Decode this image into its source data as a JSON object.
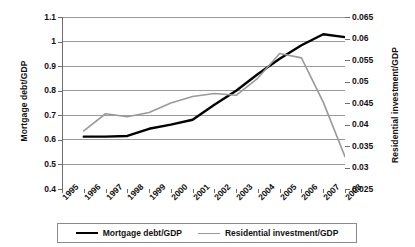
{
  "chart_data": {
    "type": "line",
    "title": "",
    "xlabel": "",
    "ylabel": "Mortgage debt/GDP",
    "y2label": "Residential investment/GDP",
    "grid": true,
    "legend_position": "bottom",
    "categories": [
      "1995",
      "1996",
      "1997",
      "1998",
      "1999",
      "2000",
      "2001",
      "2002",
      "2003",
      "2004",
      "2005",
      "2006",
      "2007",
      "2008"
    ],
    "ylim": [
      0.4,
      1.1
    ],
    "yticks": [
      "0.4",
      "0.5",
      "0.6",
      "0.7",
      "0.8",
      "0.9",
      "1",
      "1.1"
    ],
    "y2lim": [
      0.025,
      0.065
    ],
    "y2ticks": [
      "0.025",
      "0.03",
      "0.035",
      "0.04",
      "0.045",
      "0.05",
      "0.055",
      "0.06",
      "0.065"
    ],
    "series": [
      {
        "name": "Mortgage debt/GDP",
        "axis": "left",
        "color": "#000000",
        "width": 2.4,
        "values": [
          null,
          0.613,
          0.613,
          0.616,
          0.645,
          0.662,
          0.682,
          0.743,
          0.8,
          0.868,
          0.93,
          0.985,
          1.03,
          1.018
        ]
      },
      {
        "name": "Residential investment/GDP",
        "axis": "right",
        "color": "#9a9a9a",
        "width": 1.6,
        "values": [
          null,
          0.0385,
          0.0425,
          0.0418,
          0.0428,
          0.045,
          0.0465,
          0.0472,
          0.0468,
          0.0508,
          0.0565,
          0.0555,
          0.0452,
          0.0325
        ]
      }
    ]
  },
  "axis": {
    "left_title": "Mortgage debt/GDP",
    "right_title": "Residential investment/GDP"
  },
  "legend": {
    "items": [
      {
        "label": "Mortgage debt/GDP"
      },
      {
        "label": "Residential investment/GDP"
      }
    ]
  }
}
